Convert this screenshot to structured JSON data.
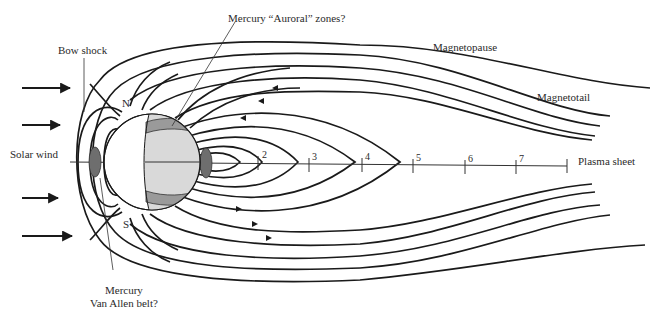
{
  "diagram": {
    "labels": {
      "auroral_zones": "Mercury “Auroral” zones?",
      "bow_shock": "Bow shock",
      "magnetopause": "Magnetopause",
      "magnetotail": "Magnetotail",
      "solar_wind": "Solar wind",
      "plasma_sheet": "Plasma sheet",
      "north": "N",
      "south": "S",
      "van_allen_line1": "Mercury",
      "van_allen_line2": "Van Allen belt?"
    },
    "scale_ticks": [
      "2",
      "3",
      "4",
      "5",
      "6",
      "7"
    ],
    "solar_wind_arrows": 5,
    "colors": {
      "line": "#1a1a1a",
      "planet_day": "#ffffff",
      "planet_night": "#d9d9d9",
      "auroral_band": "#9a9a9a",
      "belt": "#6e6e6e"
    }
  }
}
